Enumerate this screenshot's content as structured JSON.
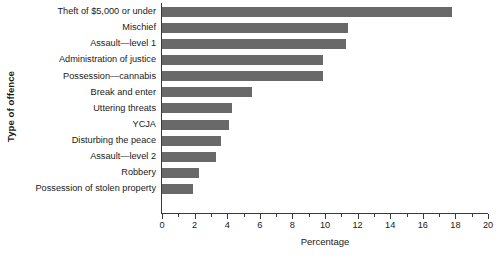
{
  "chart_data": {
    "type": "bar",
    "orientation": "horizontal",
    "title": "",
    "xlabel": "Percentage",
    "ylabel": "Type of offence",
    "xlim": [
      0,
      20
    ],
    "xticks": [
      0,
      2,
      4,
      6,
      8,
      10,
      12,
      14,
      16,
      18,
      20
    ],
    "xtick_labels": [
      "0",
      "2",
      "4",
      "6",
      "8",
      "10",
      "12",
      "14",
      "16",
      "18",
      "20"
    ],
    "minor_tick_step": 1,
    "grid": false,
    "legend": null,
    "bar_color": "#696969",
    "axis_color": "#3a3a3a",
    "categories": [
      "Theft of $5,000 or under",
      "Mischief",
      "Assault—level 1",
      "Administration of justice",
      "Possession—cannabis",
      "Break and enter",
      "Uttering threats",
      "YCJA",
      "Disturbing the peace",
      "Assault—level 2",
      "Robbery",
      "Possession of stolen property"
    ],
    "values": [
      17.8,
      11.4,
      11.3,
      9.9,
      9.9,
      5.5,
      4.3,
      4.1,
      3.6,
      3.3,
      2.3,
      1.9
    ]
  }
}
